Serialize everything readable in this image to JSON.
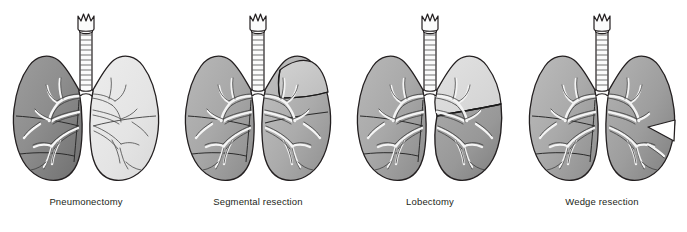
{
  "figure": {
    "type": "medical-illustration",
    "background_color": "#ffffff",
    "panel_count": 4
  },
  "palette": {
    "outline": "#231f20",
    "resected_dark": "#8c8c8c",
    "resected_mid": "#a6a6a6",
    "normal_light": "#e6e6e6",
    "normal_lighter": "#efefef",
    "airway_fill": "#fbfbfb",
    "label_color": "#231f20"
  },
  "panels": [
    {
      "id": "pneumonectomy",
      "label": "Pneumonectomy",
      "description": "Entire left lung shaded, indicating removal of the whole lung",
      "affected_side": "left",
      "affected_extent": "whole-lung",
      "left_lung_tone": "#8c8c8c",
      "right_lung_tone": "#e6e6e6"
    },
    {
      "id": "segmental-resection",
      "label": "Segmental resection",
      "description": "A single bronchopulmonary segment of the right upper lobe is outlined and shaded",
      "affected_side": "right",
      "affected_extent": "segment",
      "left_lung_tone": "#a6a6a6",
      "right_lung_tone": "#b5b5b5"
    },
    {
      "id": "lobectomy",
      "label": "Lobectomy",
      "description": "The lower lobe of the right lung is shaded, indicating removal of one lobe",
      "affected_side": "right",
      "affected_extent": "lobe",
      "left_lung_tone": "#a6a6a6",
      "right_lung_tone": "#9a9a9a"
    },
    {
      "id": "wedge-resection",
      "label": "Wedge resection",
      "description": "A small wedge of tissue is excised from the lateral edge of the right lung",
      "affected_side": "right",
      "affected_extent": "wedge",
      "left_lung_tone": "#a6a6a6",
      "right_lung_tone": "#9a9a9a"
    }
  ],
  "anatomy": {
    "larynx": "crown-shaped thyroid cartilage",
    "trachea": "segmented cartilage-ring tube",
    "carina": "tracheal bifurcation",
    "bronchial_tree": "branching airway outlines within each lung",
    "fissures": "interlobar fissure lines"
  }
}
